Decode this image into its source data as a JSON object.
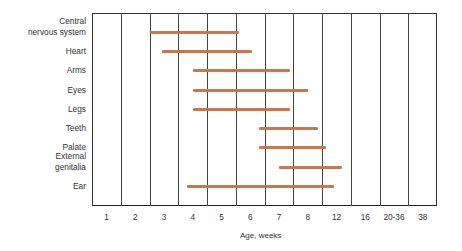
{
  "chart_data": {
    "type": "gantt-bar",
    "title": "",
    "xlabel": "Age, weeks",
    "ylabel": "",
    "categories": [
      "1",
      "2",
      "3",
      "4",
      "5",
      "6",
      "7",
      "8",
      "12",
      "16",
      "20-36",
      "38"
    ],
    "grid": true,
    "bar_color": "#c8784a",
    "rows": [
      {
        "label": "Central nervous system",
        "label_lines": [
          "Central",
          "nervous system"
        ],
        "start": 2.0,
        "end": 5.1
      },
      {
        "label": "Heart",
        "label_lines": [
          "Heart"
        ],
        "start": 2.45,
        "end": 5.55
      },
      {
        "label": "Arms",
        "label_lines": [
          "Arms"
        ],
        "start": 3.5,
        "end": 6.9
      },
      {
        "label": "Eyes",
        "label_lines": [
          "Eyes"
        ],
        "start": 3.5,
        "end": 7.5
      },
      {
        "label": "Legs",
        "label_lines": [
          "Legs"
        ],
        "start": 3.5,
        "end": 6.9
      },
      {
        "label": "Teeth",
        "label_lines": [
          "Teeth"
        ],
        "start": 5.8,
        "end": 7.85
      },
      {
        "label": "Palate",
        "label_lines": [
          "Palate"
        ],
        "start": 5.8,
        "end": 8.15
      },
      {
        "label": "External genitalia",
        "label_lines": [
          "External",
          "genitalia"
        ],
        "start": 6.5,
        "end": 8.7
      },
      {
        "label": "Ear",
        "label_lines": [
          "Ear"
        ],
        "start": 3.3,
        "end": 8.4
      }
    ],
    "value_scale_note": "start/end are positions in column units from the left axis edge (0) to right edge (12); each tick label sits centered in its column"
  }
}
